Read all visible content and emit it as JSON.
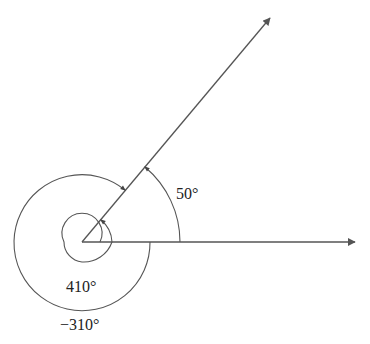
{
  "diagram": {
    "labels": {
      "angle_positive": "50°",
      "angle_coterminal_positive": "410°",
      "angle_coterminal_negative": "−310°"
    },
    "colors": {
      "stroke": "#555555",
      "text": "#222222"
    }
  }
}
